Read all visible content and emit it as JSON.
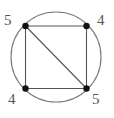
{
  "figure": {
    "type": "graph-diagram",
    "width": 114,
    "height": 118,
    "background_color": "#ffffff",
    "circle": {
      "center_x": 56,
      "center_y": 57,
      "radius": 45,
      "stroke_color": "#777777",
      "stroke_width": 1.1,
      "fill": "none"
    },
    "edge_style": {
      "stroke_color": "#555555",
      "stroke_width": 1.1
    },
    "vertex_style": {
      "fill_color": "#111111",
      "radius": 3.2
    },
    "label_style": {
      "color": "#555555",
      "font_size_px": 15
    },
    "vertices": [
      {
        "id": "tl",
        "label": "5",
        "x": 25.5,
        "y": 26.0,
        "label_position": "top-left"
      },
      {
        "id": "tr",
        "label": "4",
        "x": 86.5,
        "y": 26.0,
        "label_position": "top-right"
      },
      {
        "id": "bl",
        "label": "4",
        "x": 25.5,
        "y": 88.5,
        "label_position": "bottom-left"
      },
      {
        "id": "br",
        "label": "5",
        "x": 86.5,
        "y": 88.5,
        "label_position": "bottom-right"
      }
    ],
    "edges": [
      {
        "id": "top",
        "from": "tl",
        "to": "tr"
      },
      {
        "id": "right",
        "from": "tr",
        "to": "br"
      },
      {
        "id": "bottom",
        "from": "bl",
        "to": "br"
      },
      {
        "id": "left",
        "from": "tl",
        "to": "bl"
      },
      {
        "id": "diagonal",
        "from": "tl",
        "to": "br"
      }
    ]
  }
}
